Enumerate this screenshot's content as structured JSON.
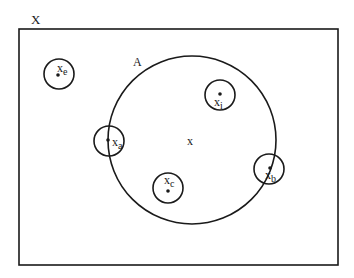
{
  "diagram": {
    "type": "set-diagram",
    "universe": {
      "label": "X",
      "rect": {
        "x": 19,
        "y": 29,
        "w": 319,
        "h": 236
      }
    },
    "set_A": {
      "label": "A",
      "center": [
        192,
        140
      ],
      "radius": 84
    },
    "center_point": {
      "label": "x"
    },
    "points": [
      {
        "id": "e",
        "label": "x",
        "sub": "e",
        "center": [
          59,
          74
        ],
        "radius": 15,
        "position": "outside A"
      },
      {
        "id": "i",
        "label": "x",
        "sub": "i",
        "center": [
          220,
          95
        ],
        "radius": 15,
        "position": "inside A"
      },
      {
        "id": "a",
        "label": "x",
        "sub": "a",
        "center": [
          109,
          141
        ],
        "radius": 15,
        "position": "on boundary of A"
      },
      {
        "id": "c",
        "label": "x",
        "sub": "c",
        "center": [
          168,
          188
        ],
        "radius": 15,
        "position": "inside A"
      },
      {
        "id": "b",
        "label": "x",
        "sub": "b",
        "center": [
          269,
          169
        ],
        "radius": 15,
        "position": "on boundary of A"
      }
    ],
    "colors": {
      "ink": "#1a1a1a",
      "background": "#ffffff"
    }
  }
}
